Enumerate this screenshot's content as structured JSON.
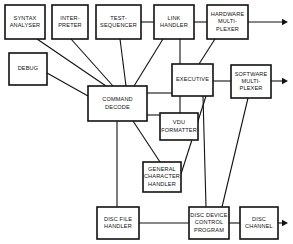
{
  "diagram": {
    "type": "block-diagram",
    "colors": {
      "background": "#ffffff",
      "stroke": "#111111",
      "box_fill": "#ffffff"
    },
    "boxes": [
      {
        "id": "syntax-analyser",
        "lines": [
          "SYNTAX",
          "ANALYSER"
        ],
        "x": 5,
        "y": 5,
        "w": 40,
        "h": 34
      },
      {
        "id": "interpreter",
        "lines": [
          "INTER-",
          "PRETER"
        ],
        "x": 52,
        "y": 5,
        "w": 36,
        "h": 34
      },
      {
        "id": "test-sequencer",
        "lines": [
          "TEST-",
          "SEQUENCER"
        ],
        "x": 96,
        "y": 5,
        "w": 45,
        "h": 34
      },
      {
        "id": "link-handler",
        "lines": [
          "LINK",
          "HANDLER"
        ],
        "x": 154,
        "y": 5,
        "w": 40,
        "h": 34
      },
      {
        "id": "hardware-multiplexer",
        "lines": [
          "HARDWARE",
          "MULTI-",
          "PLEXER"
        ],
        "x": 207,
        "y": 5,
        "w": 41,
        "h": 34
      },
      {
        "id": "debug",
        "lines": [
          "DEBUG"
        ],
        "x": 9,
        "y": 53,
        "w": 38,
        "h": 32
      },
      {
        "id": "executive",
        "lines": [
          "EXECUTIVE"
        ],
        "x": 172,
        "y": 64,
        "w": 41,
        "h": 32
      },
      {
        "id": "software-multiplexer",
        "lines": [
          "SOFTWARE",
          "MULTI-",
          "PLEXER"
        ],
        "x": 231,
        "y": 65,
        "w": 40,
        "h": 33
      },
      {
        "id": "command-decode",
        "lines": [
          "COMMAND",
          "DECODE"
        ],
        "x": 88,
        "y": 86,
        "w": 59,
        "h": 35
      },
      {
        "id": "vdu-formatter",
        "lines": [
          "VDU",
          "FORMATTER"
        ],
        "x": 160,
        "y": 113,
        "w": 38,
        "h": 27
      },
      {
        "id": "general-character-handler",
        "lines": [
          "GENERAL",
          "CHARACTER",
          "HANDLER"
        ],
        "x": 143,
        "y": 162,
        "w": 38,
        "h": 30
      },
      {
        "id": "disc-file-handler",
        "lines": [
          "DISC FILE",
          "HANDLER"
        ],
        "x": 97,
        "y": 207,
        "w": 42,
        "h": 32
      },
      {
        "id": "disc-device-control-program",
        "lines": [
          "DISC DEVICE",
          "CONTROL",
          "PROGRAM"
        ],
        "x": 189,
        "y": 207,
        "w": 40,
        "h": 32
      },
      {
        "id": "disc-channel",
        "lines": [
          "DISC",
          "CHANNEL"
        ],
        "x": 240,
        "y": 207,
        "w": 38,
        "h": 32
      }
    ],
    "connections": [
      {
        "id": "syntax-to-command",
        "from": "syntax-analyser",
        "to": "command-decode",
        "path": "M 37,39 L 106,86"
      },
      {
        "id": "interpreter-to-command",
        "from": "interpreter",
        "to": "command-decode",
        "path": "M 71,39 L 113,86"
      },
      {
        "id": "test-sequencer-to-command",
        "from": "test-sequencer",
        "to": "command-decode",
        "path": "M 120,39 L 126,86"
      },
      {
        "id": "test-sequencer-to-link",
        "from": "test-sequencer",
        "to": "link-handler",
        "path": "M 141,22 L 154,22"
      },
      {
        "id": "link-to-hardware-mux",
        "from": "link-handler",
        "to": "hardware-multiplexer",
        "path": "M 194,22 L 207,22"
      },
      {
        "id": "link-to-command",
        "from": "link-handler",
        "to": "command-decode",
        "path": "M 163,39 L 134,86"
      },
      {
        "id": "link-to-executive",
        "from": "link-handler",
        "to": "executive",
        "path": "M 180,39 L 180,64"
      },
      {
        "id": "hardware-mux-to-executive",
        "from": "hardware-multiplexer",
        "to": "executive",
        "path": "M 215,39 L 199,64"
      },
      {
        "id": "debug-to-command",
        "from": "debug",
        "to": "command-decode",
        "path": "M 47,73 L 88,96"
      },
      {
        "id": "command-to-executive",
        "from": "command-decode",
        "to": "executive",
        "path": "M 147,93 L 172,93"
      },
      {
        "id": "executive-to-software-mux",
        "from": "executive",
        "to": "software-multiplexer",
        "path": "M 213,81 L 231,81"
      },
      {
        "id": "command-to-vdu",
        "from": "command-decode",
        "to": "vdu-formatter",
        "path": "M 147,115 L 160,115"
      },
      {
        "id": "executive-to-vdu",
        "from": "executive",
        "to": "vdu-formatter",
        "path": "M 180,96 L 180,113"
      },
      {
        "id": "executive-to-gch",
        "from": "executive",
        "to": "general-character-handler",
        "path": "M 206,96 L 181,174"
      },
      {
        "id": "command-to-gch",
        "from": "command-decode",
        "to": "general-character-handler",
        "path": "M 133,121 L 160,162"
      },
      {
        "id": "command-to-disc-file",
        "from": "command-decode",
        "to": "disc-file-handler",
        "path": "M 117,121 L 117,207"
      },
      {
        "id": "disc-file-to-ddcp",
        "from": "disc-file-handler",
        "to": "disc-device-control-program",
        "path": "M 139,223 L 189,223"
      },
      {
        "id": "executive-to-ddcp",
        "from": "executive",
        "to": "disc-device-control-program",
        "path": "M 203,96 L 206,207"
      },
      {
        "id": "software-mux-to-ddcp",
        "from": "software-multiplexer",
        "to": "disc-device-control-program",
        "path": "M 248,98 L 222,207"
      },
      {
        "id": "ddcp-to-disc-channel",
        "from": "disc-device-control-program",
        "to": "disc-channel",
        "path": "M 229,223 L 240,223"
      }
    ],
    "output_arrows": [
      {
        "id": "hardware-mux-output",
        "from": "hardware-multiplexer",
        "path": "M 248,22 L 283,22",
        "tip_x": 288,
        "tip_y": 22
      },
      {
        "id": "software-mux-output",
        "from": "software-multiplexer",
        "path": "M 271,81 L 283,81",
        "tip_x": 288,
        "tip_y": 81
      },
      {
        "id": "disc-channel-output",
        "from": "disc-channel",
        "path": "M 278,223 L 283,223",
        "tip_x": 288,
        "tip_y": 223
      }
    ]
  }
}
